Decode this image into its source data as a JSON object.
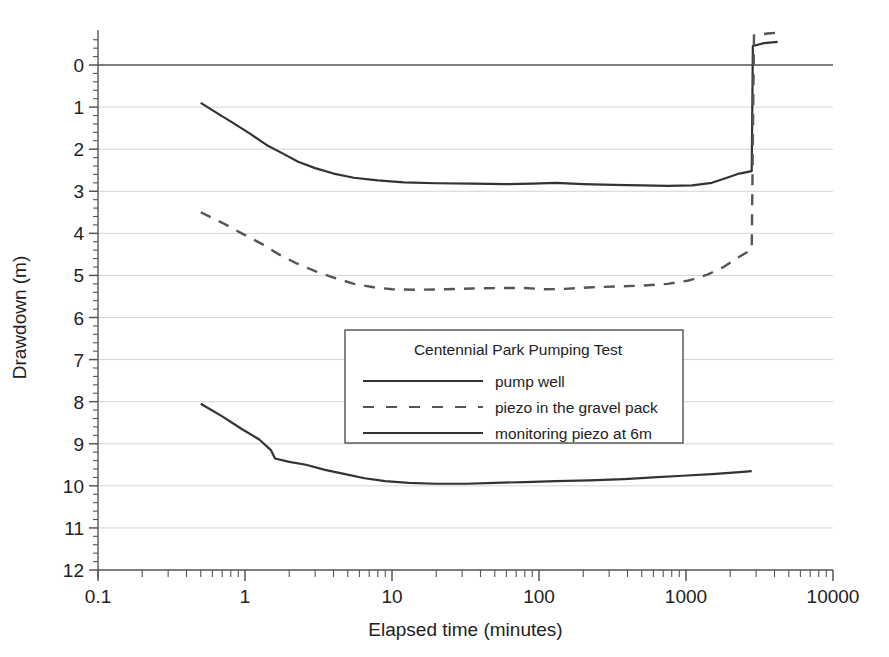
{
  "chart_data": {
    "type": "line",
    "title": "",
    "xlabel": "Elapsed time (minutes)",
    "ylabel": "Drawdown (m)",
    "xscale": "log",
    "xlim": [
      0.1,
      10000
    ],
    "ylim": [
      12,
      -0.6
    ],
    "y_inverted": true,
    "grid": true,
    "grid_axis": "y",
    "xticks": [
      "0.1",
      "1",
      "10",
      "100",
      "1000",
      "10000"
    ],
    "xtick_values": [
      0.1,
      1,
      10,
      100,
      1000,
      10000
    ],
    "yticks": [
      "0",
      "1",
      "2",
      "3",
      "4",
      "5",
      "6",
      "7",
      "8",
      "9",
      "10",
      "11",
      "12"
    ],
    "ytick_values": [
      0,
      1,
      2,
      3,
      4,
      5,
      6,
      7,
      8,
      9,
      10,
      11,
      12
    ],
    "legend": {
      "title": "Centennial Park Pumping Test",
      "position": "center",
      "entries": [
        {
          "label": "pump well",
          "style": "solid",
          "color": "#333333"
        },
        {
          "label": "piezo in the gravel pack",
          "style": "dashed",
          "color": "#555555"
        },
        {
          "label": "monitoring piezo at 6m",
          "style": "solid",
          "color": "#333333"
        }
      ]
    },
    "series": [
      {
        "name": "pump well",
        "style": "solid",
        "color": "#333333",
        "points": [
          [
            0.5,
            0.9
          ],
          [
            0.65,
            1.15
          ],
          [
            0.85,
            1.4
          ],
          [
            1.1,
            1.65
          ],
          [
            1.4,
            1.9
          ],
          [
            1.8,
            2.1
          ],
          [
            2.3,
            2.3
          ],
          [
            3.0,
            2.45
          ],
          [
            4.0,
            2.58
          ],
          [
            5.5,
            2.68
          ],
          [
            8.0,
            2.74
          ],
          [
            12.0,
            2.79
          ],
          [
            20.0,
            2.81
          ],
          [
            35.0,
            2.82
          ],
          [
            60.0,
            2.83
          ],
          [
            90.0,
            2.82
          ],
          [
            130.0,
            2.8
          ],
          [
            200.0,
            2.83
          ],
          [
            320.0,
            2.85
          ],
          [
            500.0,
            2.86
          ],
          [
            750.0,
            2.87
          ],
          [
            1100.0,
            2.86
          ],
          [
            1500.0,
            2.8
          ],
          [
            1900.0,
            2.68
          ],
          [
            2300.0,
            2.58
          ],
          [
            2800.0,
            2.52
          ],
          [
            2850.0,
            -0.45
          ],
          [
            3400.0,
            -0.52
          ],
          [
            4200.0,
            -0.55
          ]
        ]
      },
      {
        "name": "piezo in the gravel pack",
        "style": "dashed",
        "color": "#555555",
        "points": [
          [
            0.5,
            3.5
          ],
          [
            0.7,
            3.75
          ],
          [
            0.95,
            4.0
          ],
          [
            1.3,
            4.25
          ],
          [
            1.7,
            4.5
          ],
          [
            2.2,
            4.7
          ],
          [
            3.0,
            4.9
          ],
          [
            4.0,
            5.05
          ],
          [
            5.5,
            5.2
          ],
          [
            7.5,
            5.28
          ],
          [
            10.0,
            5.33
          ],
          [
            15.0,
            5.34
          ],
          [
            22.0,
            5.33
          ],
          [
            35.0,
            5.31
          ],
          [
            55.0,
            5.3
          ],
          [
            80.0,
            5.3
          ],
          [
            110.0,
            5.33
          ],
          [
            150.0,
            5.32
          ],
          [
            230.0,
            5.28
          ],
          [
            350.0,
            5.26
          ],
          [
            520.0,
            5.24
          ],
          [
            750.0,
            5.2
          ],
          [
            1050.0,
            5.12
          ],
          [
            1400.0,
            4.98
          ],
          [
            1800.0,
            4.8
          ],
          [
            2200.0,
            4.6
          ],
          [
            2600.0,
            4.45
          ],
          [
            2800.0,
            4.38
          ],
          [
            2900.0,
            -0.7
          ],
          [
            3600.0,
            -0.75
          ],
          [
            4600.0,
            -0.78
          ]
        ]
      },
      {
        "name": "monitoring piezo at 6m",
        "style": "solid",
        "color": "#333333",
        "points": [
          [
            0.5,
            8.05
          ],
          [
            0.7,
            8.35
          ],
          [
            0.95,
            8.65
          ],
          [
            1.25,
            8.9
          ],
          [
            1.5,
            9.15
          ],
          [
            1.6,
            9.35
          ],
          [
            2.0,
            9.43
          ],
          [
            2.6,
            9.5
          ],
          [
            3.5,
            9.62
          ],
          [
            4.8,
            9.72
          ],
          [
            6.5,
            9.82
          ],
          [
            9.0,
            9.89
          ],
          [
            13.0,
            9.93
          ],
          [
            20.0,
            9.95
          ],
          [
            32.0,
            9.95
          ],
          [
            50.0,
            9.93
          ],
          [
            80.0,
            9.91
          ],
          [
            130.0,
            9.89
          ],
          [
            220.0,
            9.87
          ],
          [
            380.0,
            9.84
          ],
          [
            600.0,
            9.8
          ],
          [
            950.0,
            9.76
          ],
          [
            1500.0,
            9.72
          ],
          [
            2200.0,
            9.68
          ],
          [
            2800.0,
            9.65
          ]
        ]
      }
    ]
  }
}
